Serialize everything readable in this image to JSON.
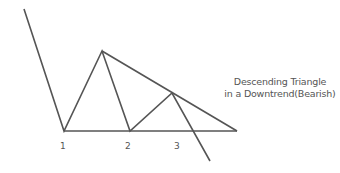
{
  "title": {
    "line1": "Descending Triangle",
    "line2": "in a Downtrend(Bearish)"
  },
  "point_labels": [
    "1",
    "2",
    "3"
  ],
  "colors": {
    "line": "#555555",
    "text": "#555555",
    "background": "#ffffff"
  },
  "diagram": {
    "type": "chart pattern diagram",
    "price_path": [
      [
        24,
        9
      ],
      [
        64,
        131
      ],
      [
        102,
        51
      ],
      [
        130,
        131
      ],
      [
        172,
        93
      ],
      [
        210,
        161
      ]
    ],
    "support_line": [
      [
        64,
        131
      ],
      [
        237,
        131
      ]
    ],
    "resistance_line": [
      [
        102,
        51
      ],
      [
        237,
        131
      ]
    ]
  }
}
